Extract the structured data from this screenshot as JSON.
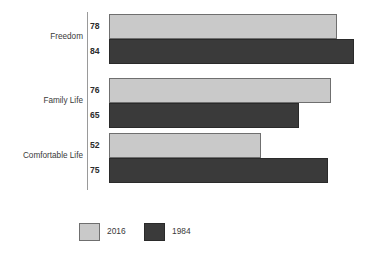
{
  "chart_data": {
    "type": "bar",
    "orientation": "horizontal",
    "title": "",
    "xlabel": "",
    "ylabel": "",
    "grid": false,
    "xlim": [
      0,
      91
    ],
    "axis_ticks_visible": false,
    "legend_position": "bottom",
    "categories": [
      "Freedom",
      "Family Life",
      "Comfortable Life"
    ],
    "series": [
      {
        "name": "2016",
        "color": "#c9c9c9",
        "values": [
          78,
          76,
          52
        ],
        "labels": [
          "78",
          "76",
          "52"
        ]
      },
      {
        "name": "1984",
        "color": "#3a3a3a",
        "values": [
          84,
          65,
          75
        ],
        "labels": [
          "84",
          "65",
          "75"
        ]
      }
    ]
  },
  "style": {
    "light_fill": "#c9c9c9",
    "light_stroke": "#6f6f6f",
    "dark_fill": "#3a3a3a",
    "dark_stroke": "#2a2a2a",
    "axis_color": "#9a9a9a",
    "text_color": "#3a3a3a",
    "background": "#ffffff"
  },
  "geometry": {
    "px_per_unit": 2.92,
    "bar_origin_x": 109,
    "axis_x": 87
  }
}
